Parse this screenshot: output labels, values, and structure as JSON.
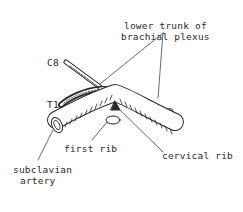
{
  "diagram": {
    "labels": {
      "lower_trunk_line1": "lower trunk of",
      "lower_trunk_line2": "brachial plexus",
      "c8": "C8",
      "t1": "T1",
      "first_rib": "first rib",
      "cervical_rib": "cervical rib",
      "subclavian_line1": "subclavian",
      "subclavian_line2": "artery"
    },
    "colors": {
      "ink": "#2a2a2a",
      "background": "#ffffff"
    }
  }
}
